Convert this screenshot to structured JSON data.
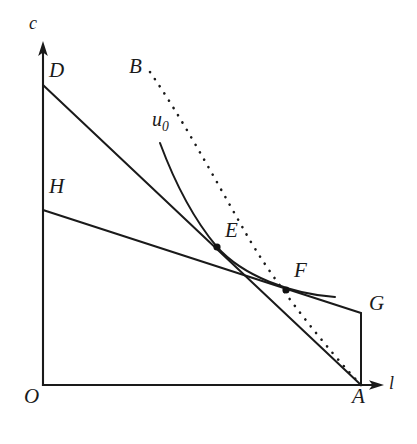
{
  "figure": {
    "background_color": "#ffffff",
    "stroke_color": "#1a1a1a",
    "width": 417,
    "height": 444
  },
  "axes": {
    "y_label": "c",
    "x_label": "l",
    "origin_label": "O",
    "origin": {
      "x": 43,
      "y": 385
    },
    "y_axis_top": {
      "x": 43,
      "y": 44
    },
    "x_axis_right": {
      "x": 383,
      "y": 385
    }
  },
  "points": [
    {
      "id": "O",
      "label": "O",
      "x": 43,
      "y": 385,
      "label_x": 24,
      "label_y": 388,
      "dot": false
    },
    {
      "id": "D",
      "label": "D",
      "x": 43,
      "y": 85,
      "label_x": 49,
      "label_y": 62,
      "dot": false
    },
    {
      "id": "H",
      "label": "H",
      "x": 43,
      "y": 210,
      "label_x": 49,
      "label_y": 178,
      "dot": false
    },
    {
      "id": "B",
      "label": "B",
      "x": 150,
      "y": 72,
      "label_x": 129,
      "label_y": 58,
      "dot": false
    },
    {
      "id": "E",
      "label": "E",
      "x": 217,
      "y": 247,
      "label_x": 225,
      "label_y": 222,
      "dot": true
    },
    {
      "id": "F",
      "label": "F",
      "x": 286,
      "y": 290,
      "label_x": 294,
      "label_y": 262,
      "dot": true
    },
    {
      "id": "G",
      "label": "G",
      "x": 361,
      "y": 313,
      "label_x": 369,
      "label_y": 295,
      "dot": false
    },
    {
      "id": "A",
      "label": "A",
      "x": 361,
      "y": 385,
      "label_x": 352,
      "label_y": 388,
      "dot": false
    }
  ],
  "curves": {
    "budget_DA": {
      "name": "Original budget line D-A",
      "style": "solid",
      "from": "D",
      "to": "A",
      "path": "M 43 85 L 361 385"
    },
    "budget_HG": {
      "name": "Compensated budget line H-G",
      "style": "solid",
      "from": "H",
      "to": "G",
      "path": "M 43 210 L 361 313"
    },
    "segment_GA": {
      "name": "Vertical segment G to A",
      "style": "solid",
      "from": "G",
      "to": "A",
      "path": "M 361 313 L 361 385"
    },
    "indifference_u0": {
      "name": "Indifference curve u0 through E and F",
      "label": "u",
      "label_subscript": "0",
      "label_x": 152,
      "label_y": 110,
      "style": "solid",
      "path": "M 160 143 C 176 186 196 222 217 247 C 243 276 291 294 335 297"
    },
    "dotted_BA": {
      "name": "Dotted income expansion / offer curve B to A",
      "style": "dotted",
      "path": "M 150 72 C 182 118 212 174 244 230 C 274 284 330 352 361 385"
    }
  },
  "axis_labels": {
    "c": {
      "text": "c",
      "x": 29,
      "y": 16
    },
    "l": {
      "text": "l",
      "x": 389,
      "y": 377
    }
  }
}
